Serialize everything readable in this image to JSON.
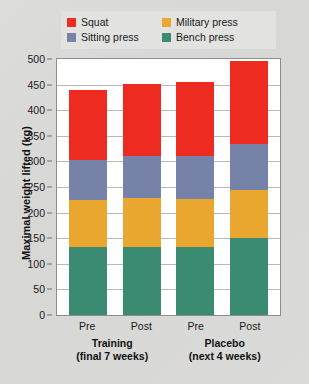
{
  "chart_data": {
    "type": "bar",
    "subtype": "stacked-bar",
    "title": "",
    "xlabel": "",
    "ylabel": "Maximal weight lifted (kg)",
    "ylim": [
      0,
      500
    ],
    "ytick_step": 50,
    "yticks": [
      "500",
      "450",
      "400",
      "350",
      "300",
      "250",
      "200",
      "150",
      "100",
      "50",
      "0"
    ],
    "grid": true,
    "legend_position": "top",
    "categories": [
      "Pre",
      "Post",
      "Pre",
      "Post"
    ],
    "groups": [
      {
        "label": "Training",
        "sublabel": "(final 7 weeks)",
        "categories": [
          "Pre",
          "Post"
        ]
      },
      {
        "label": "Placebo",
        "sublabel": "(next 4 weeks)",
        "categories": [
          "Pre",
          "Post"
        ]
      }
    ],
    "series": [
      {
        "name": "Bench press",
        "color": "#3b8a72",
        "values": [
          132,
          133,
          133,
          150
        ]
      },
      {
        "name": "Military press",
        "color": "#e9a730",
        "values": [
          92,
          95,
          94,
          94
        ]
      },
      {
        "name": "Sitting press",
        "color": "#7782a8",
        "values": [
          79,
          82,
          83,
          91
        ]
      },
      {
        "name": "Squat",
        "color": "#ee2b20",
        "values": [
          137,
          142,
          145,
          162
        ]
      }
    ],
    "stack_order_bottom_to_top": [
      "Bench press",
      "Military press",
      "Sitting press",
      "Squat"
    ],
    "totals": [
      440,
      452,
      455,
      497
    ]
  },
  "legend": {
    "items": [
      {
        "label": "Squat",
        "color": "#ee2b20"
      },
      {
        "label": "Military press",
        "color": "#e9a730"
      },
      {
        "label": "Sitting press",
        "color": "#7782a8"
      },
      {
        "label": "Bench press",
        "color": "#3b8a72"
      }
    ]
  },
  "colors": {
    "squat": "#ee2b20",
    "military_press": "#e9a730",
    "sitting_press": "#7782a8",
    "bench_press": "#3b8a72",
    "background": "#dcdcda",
    "plot_background": "#ffffff",
    "gridline": "#b9b9b9",
    "axis": "#8c8c8c"
  }
}
